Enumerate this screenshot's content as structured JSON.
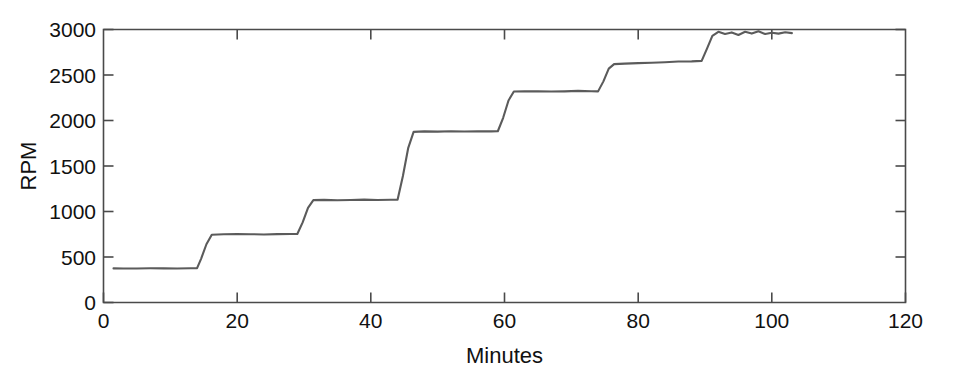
{
  "chart_data": {
    "type": "line",
    "title": "",
    "subtitle": "",
    "xlabel": "Minutes",
    "ylabel": "RPM",
    "xlim": [
      0,
      120
    ],
    "ylim": [
      0,
      3000
    ],
    "xticks": [
      0,
      20,
      40,
      60,
      80,
      100,
      120
    ],
    "xtick_labels": [
      "0",
      "20",
      "40",
      "60",
      "80",
      "100",
      "120"
    ],
    "yticks": [
      0,
      500,
      1000,
      1500,
      2000,
      2500,
      3000
    ],
    "ytick_labels": [
      "0",
      "500",
      "1000",
      "1500",
      "2000",
      "2500",
      "3000"
    ],
    "grid": false,
    "legend": null,
    "legend_position": "none",
    "line_color": "#5b5b5b",
    "axis_color": "#4a4a4a",
    "background_color": "#ffffff",
    "series": [
      {
        "name": "RPM",
        "x": [
          1.5,
          3,
          5,
          7,
          9,
          11,
          13,
          14.0,
          14.6,
          15.4,
          16.2,
          18,
          20,
          22,
          24,
          26,
          28,
          29.0,
          29.8,
          30.6,
          31.4,
          33,
          35,
          37,
          39,
          41,
          43,
          44.0,
          44.8,
          45.6,
          46.4,
          48,
          50,
          52,
          54,
          56,
          58,
          59.0,
          59.8,
          60.6,
          61.4,
          63,
          65,
          67,
          69,
          71,
          73,
          74.0,
          74.8,
          75.6,
          76.4,
          78,
          80,
          82,
          84,
          86,
          88,
          89.5,
          90.3,
          91.1,
          92.0,
          93,
          94,
          95,
          96,
          97,
          98,
          99,
          100,
          101,
          102,
          103
        ],
        "y": [
          375,
          373,
          374,
          376,
          375,
          374,
          376,
          377,
          480,
          640,
          745,
          750,
          752,
          750,
          748,
          751,
          752,
          753,
          880,
          1040,
          1125,
          1128,
          1124,
          1126,
          1130,
          1127,
          1129,
          1130,
          1390,
          1700,
          1875,
          1880,
          1878,
          1882,
          1879,
          1881,
          1880,
          1882,
          2030,
          2220,
          2318,
          2320,
          2322,
          2318,
          2320,
          2325,
          2322,
          2320,
          2430,
          2570,
          2620,
          2625,
          2630,
          2635,
          2640,
          2648,
          2650,
          2655,
          2790,
          2930,
          2975,
          2950,
          2968,
          2940,
          2975,
          2955,
          2980,
          2950,
          2965,
          2955,
          2970,
          2960
        ]
      }
    ],
    "plateaus": [
      {
        "index": 1,
        "value_rpm": 375,
        "start_min": 1.5,
        "end_min": 14
      },
      {
        "index": 2,
        "value_rpm": 750,
        "start_min": 16,
        "end_min": 29
      },
      {
        "index": 3,
        "value_rpm": 1125,
        "start_min": 31,
        "end_min": 44
      },
      {
        "index": 4,
        "value_rpm": 1880,
        "start_min": 46,
        "end_min": 59
      },
      {
        "index": 5,
        "value_rpm": 2320,
        "start_min": 61,
        "end_min": 74
      },
      {
        "index": 6,
        "value_rpm": 2630,
        "start_min": 76,
        "end_min": 90
      },
      {
        "index": 7,
        "value_rpm": 2965,
        "start_min": 92,
        "end_min": 103
      }
    ]
  }
}
